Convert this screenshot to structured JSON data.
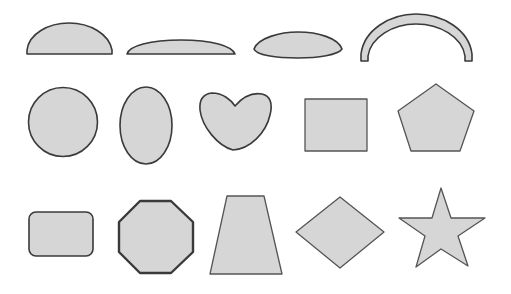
{
  "diagram": {
    "description": "Grid of 14 filled 2D geometric shapes arranged in three rows",
    "colors": {
      "fill": "#d6d6d6",
      "stroke": "#3a3a3a",
      "background": "#ffffff"
    },
    "rows": [
      {
        "label": "row-1",
        "shapes": [
          {
            "name": "half-dome",
            "type": "semi-ellipse"
          },
          {
            "name": "flat-dome",
            "type": "circular-segment"
          },
          {
            "name": "lens",
            "type": "lens"
          },
          {
            "name": "arch",
            "type": "arch"
          }
        ]
      },
      {
        "label": "row-2",
        "shapes": [
          {
            "name": "circle",
            "type": "circle"
          },
          {
            "name": "oval",
            "type": "ellipse"
          },
          {
            "name": "heart",
            "type": "heart"
          },
          {
            "name": "rectangle",
            "type": "rectangle"
          },
          {
            "name": "pentagon",
            "type": "pentagon"
          }
        ]
      },
      {
        "label": "row-3",
        "shapes": [
          {
            "name": "rounded-rectangle",
            "type": "rounded-rectangle"
          },
          {
            "name": "octagon",
            "type": "octagon"
          },
          {
            "name": "trapezoid",
            "type": "trapezoid"
          },
          {
            "name": "diamond",
            "type": "rhombus"
          },
          {
            "name": "star",
            "type": "five-point-star"
          }
        ]
      }
    ]
  }
}
